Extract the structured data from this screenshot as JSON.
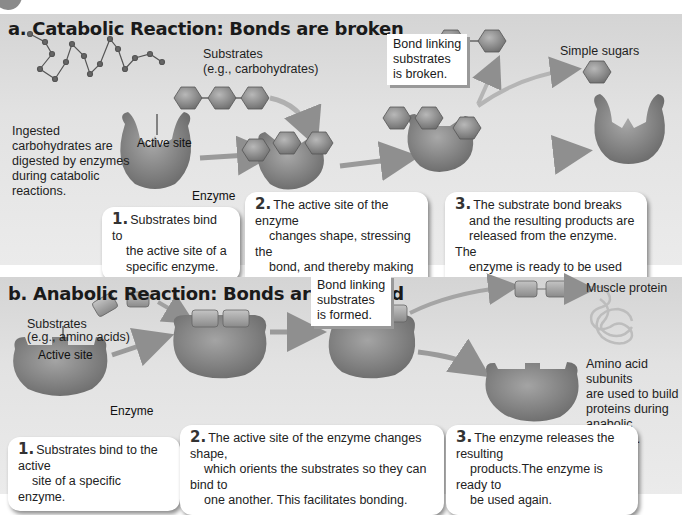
{
  "panel_a": {
    "title": "a. Catabolic Reaction: Bonds are broken",
    "substrates_label_line1": "Substrates",
    "substrates_label_line2": "(e.g., carbohydrates)",
    "ingested_note": [
      "Ingested",
      "carbohydrates are",
      "digested by enzymes",
      "during catabolic",
      "reactions."
    ],
    "active_site_label": "Active site",
    "enzyme_label": "Enzyme",
    "callout": [
      "Bond linking",
      "substrates",
      "is broken."
    ],
    "product_label": "Simple sugars",
    "steps": [
      {
        "num": "1.",
        "lines": [
          "Substrates bind to",
          "the active site of a",
          "specific enzyme."
        ]
      },
      {
        "num": "2.",
        "lines": [
          "The active site of the enzyme",
          "changes shape, stressing the",
          "bond, and thereby making it",
          "easier to break."
        ]
      },
      {
        "num": "3.",
        "lines": [
          "The substrate bond breaks",
          "and the resulting products are",
          "released from the enzyme. The",
          "enzyme is ready to be  used again."
        ]
      }
    ]
  },
  "panel_b": {
    "title": "b. Anabolic Reaction: Bonds are created",
    "substrates_label_line1": "Substrates",
    "substrates_label_line2": "(e.g., amino acids)",
    "active_site_label": "Active site",
    "enzyme_label": "Enzyme",
    "callout": [
      "Bond linking",
      "substrates",
      "is formed."
    ],
    "product_label": "Muscle protein",
    "product_note": [
      "Amino acid subunits",
      "are used to build",
      "proteins during",
      "anabolic reactions."
    ],
    "steps": [
      {
        "num": "1.",
        "lines": [
          "Substrates bind to the active",
          "site of a specific enzyme."
        ]
      },
      {
        "num": "2.",
        "lines": [
          "The active site of the enzyme changes shape,",
          "which orients the substrates so they can bind to",
          "one another. This facilitates bonding."
        ]
      },
      {
        "num": "3.",
        "lines": [
          "The enzyme releases the resulting",
          "products.The enzyme is ready to",
          "be used again."
        ]
      }
    ]
  },
  "colors": {
    "panel_bg": "#e0e0e0",
    "enzyme": "#8c8c8c",
    "substrate": "#9a9a9a",
    "arrow": "#9b9b9b"
  }
}
